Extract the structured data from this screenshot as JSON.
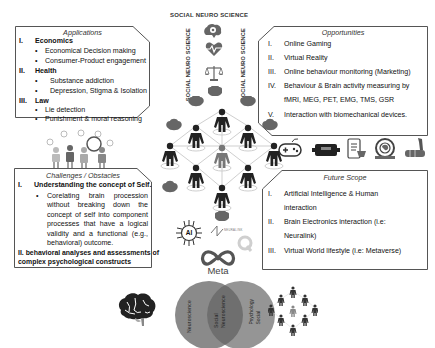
{
  "title": "SOCIAL NEURO SCIENCE",
  "side_labels": {
    "left": "SOCIAL NEURO SCIENCE",
    "right": "SOCIAL NEURO SCIENCE"
  },
  "applications": {
    "title": "Applications",
    "sections": [
      {
        "num": "I.",
        "label": "Economics",
        "items": [
          "Economical Decision making",
          "Consumer-Product engagement"
        ]
      },
      {
        "num": "II.",
        "label": "Health",
        "items": [
          "Substance addiction",
          "Depression, Stigma & Isolation"
        ]
      },
      {
        "num": "III.",
        "label": "Law",
        "items": [
          "Lie detection",
          "Punishment & moral reasoning"
        ]
      }
    ]
  },
  "opportunities": {
    "title": "Opportunities",
    "items": [
      {
        "num": "I.",
        "text": "Online Gaming"
      },
      {
        "num": "II.",
        "text": "Virtual Reality"
      },
      {
        "num": "III.",
        "text": "Online behaviour monitoring (Marketing)"
      },
      {
        "num": "IV.",
        "text": "Behaviour & Brain activity measuring by",
        "text2": "fMRI, MEG, PET, EMG, TMS, GSR"
      },
      {
        "num": "V.",
        "text": "Interaction with biomechanical devices."
      }
    ]
  },
  "challenges": {
    "title": "Challenges / Obstacles",
    "section1": {
      "num": "I.",
      "label": "Understanding the concept of Self."
    },
    "bullet_lines": [
      "Corelating brain procession",
      "without breaking down the",
      "concept of self into component",
      "processes that have a logical",
      "validity and a functional (e.g.,",
      "behavioral) outcome."
    ],
    "section2_line1": "II. behavioral analyses and assessments of",
    "section2_line2": "complex psychological constructs"
  },
  "future_scope": {
    "title": "Future Scope",
    "items": [
      {
        "num": "I.",
        "text": "Artificial Intelligence & Human",
        "text2": "interaction"
      },
      {
        "num": "II.",
        "text": "Brain Electronics interaction (i.e:",
        "text2": "Neuralink)"
      },
      {
        "num": "III.",
        "text": "Virtual World lifestyle (i.e: Metaverse)"
      }
    ]
  },
  "logos": {
    "meta": "Meta",
    "ai": "AI",
    "neuralink": "NEURALINK"
  },
  "venn": {
    "left": "Neuroscience",
    "center_line1": "Social",
    "center_line2": "Neuroscience",
    "right_line1": "Social",
    "right_line2": "Psychology"
  },
  "bullet": "•",
  "colors": {
    "border": "#555555",
    "figure": "#222222",
    "venn": "#8a8a8a",
    "venn_overlap": "#6f6f6f"
  }
}
